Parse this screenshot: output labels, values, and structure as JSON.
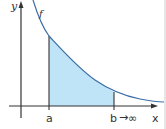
{
  "diagram": {
    "type": "improper-integral-illustration",
    "axes": {
      "x_label": "x",
      "y_label": "y"
    },
    "curve": {
      "label": "f",
      "color": "#3a6ea5"
    },
    "region": {
      "fill_color": "#bfe3f7",
      "lower_bound_label": "a",
      "upper_bound_label": "b",
      "limit_arrow": "→",
      "limit_value": "∞"
    },
    "colors": {
      "axis": "#333333",
      "background": "#ffffff"
    }
  }
}
